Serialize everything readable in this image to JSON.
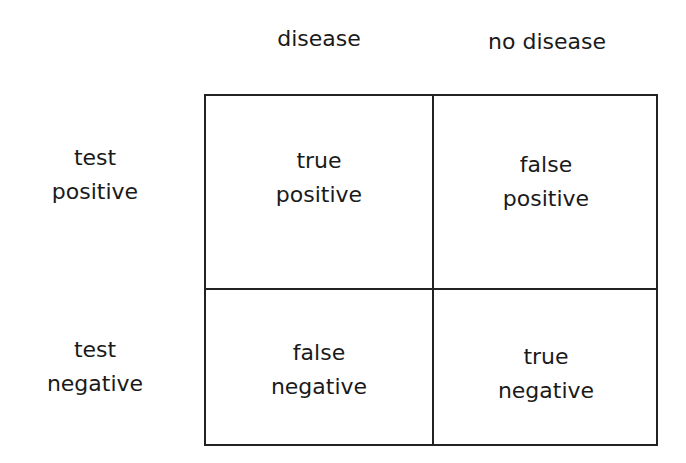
{
  "columns": [
    "disease",
    "no disease"
  ],
  "rows": [
    "test\npositive",
    "test\nnegative"
  ],
  "cells": [
    [
      "true\npositive",
      "false\npositive"
    ],
    [
      "false\nnegative",
      "true\nnegative"
    ]
  ]
}
